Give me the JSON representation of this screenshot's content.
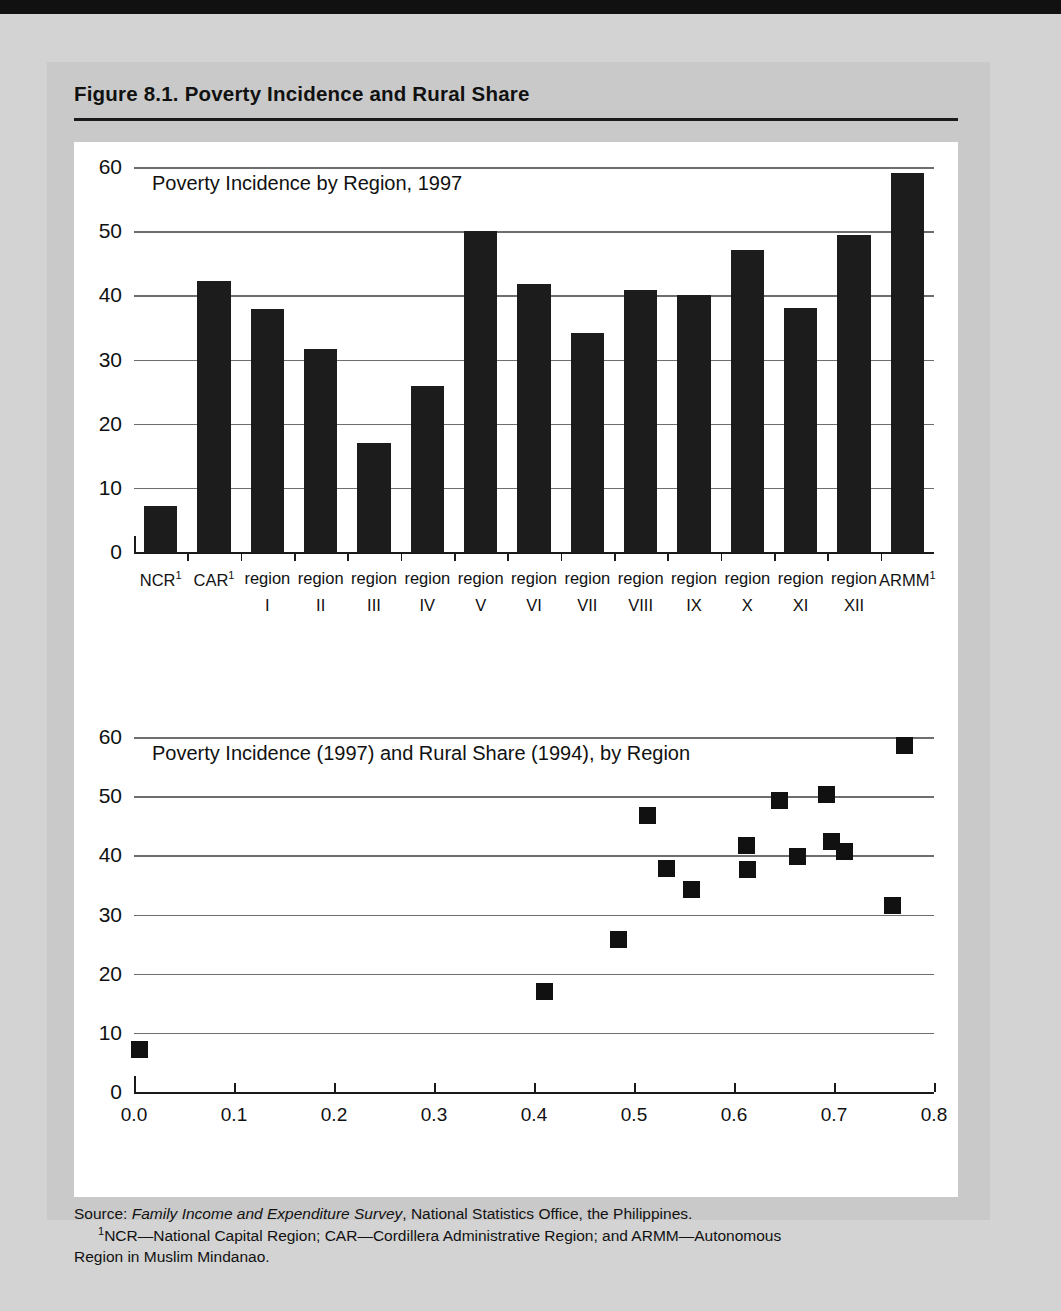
{
  "figure": {
    "title": "Figure 8.1.  Poverty Incidence and Rural Share"
  },
  "footnotes": {
    "source_label": "Source:",
    "source_italic": "Family Income and Expenditure Survey",
    "source_rest": ", National Statistics Office, the Philippines.",
    "note_marker": "1",
    "note_line1": "NCR—National Capital Region; CAR—Cordillera Administrative Region; and ARMM—Autonomous",
    "note_line2": "Region in Muslim Mindanao."
  },
  "chart_data": [
    {
      "type": "bar",
      "title": "Poverty Incidence by Region, 1997",
      "xlabel": "",
      "ylabel": "",
      "ylim": [
        0,
        60
      ],
      "yticks": [
        0,
        10,
        20,
        30,
        40,
        50,
        60
      ],
      "grid": true,
      "legend": "none",
      "categories": [
        "NCR¹",
        "CAR¹",
        "region I",
        "region II",
        "region III",
        "region IV",
        "region V",
        "region VI",
        "region VII",
        "region VIII",
        "region IX",
        "region X",
        "region XI",
        "region XII",
        "ARMM¹"
      ],
      "category_top": [
        "NCR",
        "CAR",
        "region",
        "region",
        "region",
        "region",
        "region",
        "region",
        "region",
        "region",
        "region",
        "region",
        "region",
        "region",
        "ARMM"
      ],
      "category_sup": [
        "1",
        "1",
        "",
        "",
        "",
        "",
        "",
        "",
        "",
        "",
        "",
        "",
        "",
        "",
        "1"
      ],
      "category_bottom": [
        "",
        "",
        "I",
        "II",
        "III",
        "IV",
        "V",
        "VI",
        "VII",
        "VIII",
        "IX",
        "X",
        "XI",
        "XII",
        ""
      ],
      "values": [
        7.2,
        42.3,
        37.8,
        31.7,
        17.0,
        25.8,
        50.0,
        41.7,
        34.2,
        40.8,
        40.0,
        47.0,
        38.0,
        49.4,
        59.0
      ]
    },
    {
      "type": "scatter",
      "title": "Poverty Incidence (1997) and Rural Share (1994), by Region",
      "xlabel": "",
      "ylabel": "",
      "xlim": [
        0.0,
        0.8
      ],
      "ylim": [
        0,
        60
      ],
      "xticks": [
        0.0,
        0.1,
        0.2,
        0.3,
        0.4,
        0.5,
        0.6,
        0.7,
        0.8
      ],
      "xtick_labels": [
        "0.0",
        "0.1",
        "0.2",
        "0.3",
        "0.4",
        "0.5",
        "0.6",
        "0.7",
        "0.8"
      ],
      "yticks": [
        0,
        10,
        20,
        30,
        40,
        50,
        60
      ],
      "grid": true,
      "legend": "none",
      "series": [
        {
          "name": "Regions",
          "marker": "square",
          "color": "#111111",
          "points": [
            {
              "label": "NCR",
              "x": 0.005,
              "y": 7.2
            },
            {
              "label": "region III",
              "x": 0.41,
              "y": 17.0
            },
            {
              "label": "region IV",
              "x": 0.484,
              "y": 25.8
            },
            {
              "label": "region X",
              "x": 0.513,
              "y": 46.8
            },
            {
              "label": "region I",
              "x": 0.532,
              "y": 37.8
            },
            {
              "label": "region VII",
              "x": 0.557,
              "y": 34.2
            },
            {
              "label": "region VI",
              "x": 0.612,
              "y": 41.7
            },
            {
              "label": "region IX",
              "x": 0.613,
              "y": 37.6
            },
            {
              "label": "region XII",
              "x": 0.645,
              "y": 49.2
            },
            {
              "label": "region VIII",
              "x": 0.663,
              "y": 39.8
            },
            {
              "label": "region V",
              "x": 0.692,
              "y": 50.2
            },
            {
              "label": "region XI",
              "x": 0.697,
              "y": 42.4
            },
            {
              "label": "CAR",
              "x": 0.71,
              "y": 40.7
            },
            {
              "label": "region II",
              "x": 0.758,
              "y": 31.5
            },
            {
              "label": "ARMM",
              "x": 0.77,
              "y": 58.6
            }
          ]
        }
      ]
    }
  ]
}
